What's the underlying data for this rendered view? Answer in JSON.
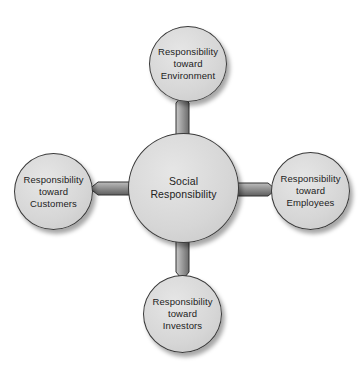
{
  "diagram": {
    "title": "",
    "center": {
      "label": "Social\nResponsibility",
      "cx": 183,
      "cy": 188,
      "r": 55
    },
    "nodes": [
      {
        "id": "environment",
        "label": "Responsibility\ntoward\nEnvironment",
        "cx": 188,
        "cy": 64,
        "r": 38,
        "direction": "up"
      },
      {
        "id": "customers",
        "label": "Responsibility\ntoward\nCustomers",
        "cx": 53,
        "cy": 191,
        "r": 39,
        "direction": "left"
      },
      {
        "id": "employees",
        "label": "Responsibility\ntoward\nEmployees",
        "cx": 310,
        "cy": 190,
        "r": 39,
        "direction": "right"
      },
      {
        "id": "investors",
        "label": "Responsibility\ntoward\nInvestors",
        "cx": 182,
        "cy": 313,
        "r": 39,
        "direction": "down"
      }
    ],
    "colors": {
      "node_fill": "#d8d8d8",
      "node_border": "#3a3a3a",
      "arrow_dark": "#6a6a6a",
      "arrow_light": "#c8c8c8",
      "background": "#ffffff"
    }
  }
}
